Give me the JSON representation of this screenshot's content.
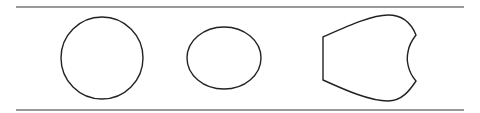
{
  "diagram": {
    "colors": {
      "stroke": "#222222",
      "rule": "#777777",
      "background": "#ffffff"
    },
    "shapes": [
      {
        "name": "circle",
        "cx": 102,
        "cy": 58,
        "r": 41
      },
      {
        "name": "ellipse",
        "cx": 224,
        "cy": 58,
        "rx": 37,
        "ry": 31
      },
      {
        "name": "notched-shield"
      }
    ]
  }
}
